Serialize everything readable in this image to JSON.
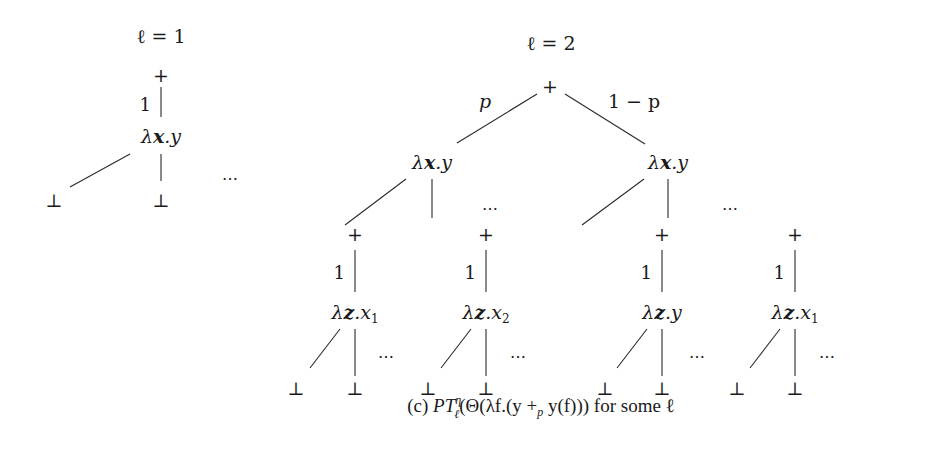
{
  "figure": {
    "caption": {
      "label": "(c)",
      "formula_pre": "PT",
      "formula_sup": "η",
      "formula_sub": "ℓ",
      "formula_body": "(Θ(λf.(y +",
      "formula_plus_sub": "p",
      "formula_tail": " y(f)))",
      "suffix": " for some ℓ"
    },
    "tree_l1": {
      "title": "ℓ = 1",
      "root": "+",
      "edge_label": "1",
      "node": {
        "lambda": "λ",
        "var": "x",
        "body": ".y"
      },
      "leaves": [
        "⊥",
        "⊥"
      ],
      "ellipsis": "…"
    },
    "tree_l2": {
      "title": "ℓ = 2",
      "root": "+",
      "edge_left_label": "p",
      "edge_right_label": "1 − p",
      "left_node": {
        "lambda": "λ",
        "var": "x",
        "body": ".y"
      },
      "right_node": {
        "lambda": "λ",
        "var": "x",
        "body": ".y"
      },
      "mid_ellipsis": "…",
      "right_ellipsis": "…",
      "subtrees": [
        {
          "plus": "+",
          "edge_label": "1",
          "lambda": "λ",
          "var": "z",
          "body": ".x",
          "sub": "1",
          "leaves": [
            "⊥",
            "⊥"
          ],
          "ellipsis": "…"
        },
        {
          "plus": "+",
          "edge_label": "1",
          "lambda": "λ",
          "var": "z",
          "body": ".x",
          "sub": "2",
          "leaves": [
            "⊥",
            "⊥"
          ],
          "ellipsis": "…"
        },
        {
          "plus": "+",
          "edge_label": "1",
          "lambda": "λ",
          "var": "z",
          "body": ".y",
          "sub": "",
          "leaves": [
            "⊥",
            "⊥"
          ],
          "ellipsis": "…"
        },
        {
          "plus": "+",
          "edge_label": "1",
          "lambda": "λ",
          "var": "z",
          "body": ".x",
          "sub": "1",
          "leaves": [
            "⊥",
            "⊥"
          ],
          "ellipsis": "…"
        }
      ]
    }
  }
}
